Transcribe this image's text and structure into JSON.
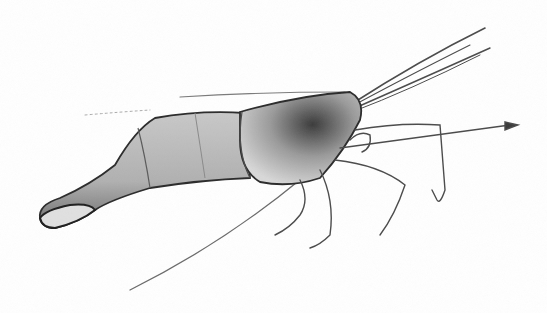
{
  "image": {
    "subject": "shrimp",
    "style": "pencil sketch illustration",
    "background": "#ffffff",
    "ink": "#2a2a2a",
    "shading": "#8a8a8a"
  }
}
